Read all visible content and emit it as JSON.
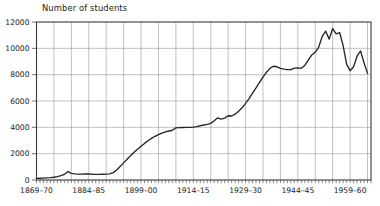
{
  "chart_data": {
    "type": "line",
    "title": "Number of students",
    "xlabel": "",
    "ylabel": "",
    "ylim": [
      0,
      12000
    ],
    "xlim": [
      1869,
      1965
    ],
    "grid": true,
    "legend": "none",
    "y_ticks": [
      0,
      2000,
      4000,
      6000,
      8000,
      10000,
      12000
    ],
    "y_tick_labels": [
      "0",
      "2000",
      "4000",
      "6000",
      "8000",
      "10000",
      "12000"
    ],
    "x_tick_labels": [
      "1869–70",
      "1884–85",
      "1899–00",
      "1914–15",
      "1929–30",
      "1944–45",
      "1959–60"
    ],
    "x_tick_years": [
      1869,
      1884,
      1899,
      1914,
      1929,
      1944,
      1959
    ],
    "x_minor_tick_interval": 1,
    "x_gridline_interval": 5,
    "series": [
      {
        "name": "Number of students",
        "color": "#262626",
        "x": [
          1869,
          1870,
          1871,
          1872,
          1873,
          1874,
          1875,
          1876,
          1877,
          1878,
          1879,
          1880,
          1881,
          1882,
          1883,
          1884,
          1885,
          1886,
          1887,
          1888,
          1889,
          1890,
          1891,
          1892,
          1893,
          1894,
          1895,
          1896,
          1897,
          1898,
          1899,
          1900,
          1901,
          1902,
          1903,
          1904,
          1905,
          1906,
          1907,
          1908,
          1909,
          1910,
          1911,
          1912,
          1913,
          1914,
          1915,
          1916,
          1917,
          1918,
          1919,
          1920,
          1921,
          1922,
          1923,
          1924,
          1925,
          1926,
          1927,
          1928,
          1929,
          1930,
          1931,
          1932,
          1933,
          1934,
          1935,
          1936,
          1937,
          1938,
          1939,
          1940,
          1941,
          1942,
          1943,
          1944,
          1945,
          1946,
          1947,
          1948,
          1949,
          1950,
          1951,
          1952,
          1953,
          1954,
          1955,
          1956,
          1957,
          1958,
          1959,
          1960,
          1961,
          1962,
          1963,
          1964
        ],
        "values": [
          120,
          130,
          140,
          160,
          180,
          210,
          260,
          330,
          420,
          640,
          500,
          460,
          450,
          450,
          455,
          460,
          440,
          430,
          430,
          440,
          450,
          460,
          560,
          760,
          1020,
          1300,
          1580,
          1850,
          2100,
          2330,
          2560,
          2780,
          2980,
          3160,
          3320,
          3440,
          3560,
          3660,
          3720,
          3780,
          3960,
          3980,
          3990,
          4000,
          4000,
          4010,
          4060,
          4120,
          4180,
          4220,
          4300,
          4500,
          4720,
          4620,
          4700,
          4880,
          4860,
          5000,
          5220,
          5480,
          5820,
          6180,
          6600,
          7000,
          7420,
          7820,
          8180,
          8480,
          8640,
          8600,
          8480,
          8420,
          8380,
          8380,
          8500,
          8520,
          8480,
          8700,
          9100,
          9500,
          9700,
          10100,
          10900,
          11300,
          10700,
          11500,
          11100,
          11200,
          10200,
          8800,
          8300,
          8600,
          9400,
          9800,
          8900,
          8100
        ]
      }
    ]
  }
}
